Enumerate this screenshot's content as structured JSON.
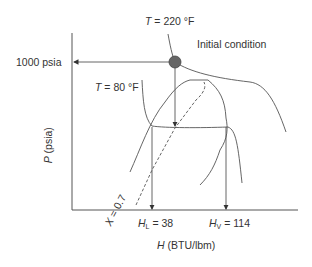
{
  "labels": {
    "t_high_var": "T",
    "t_high_val": " = 220 °F",
    "t_low_var": "T",
    "t_low_val": " = 80 °F",
    "initial_condition": "Initial condition",
    "pressure": "1000 psia",
    "y_axis_var": "P",
    "y_axis_unit": " (psia)",
    "x_axis_var": "H",
    "x_axis_unit": " (BTU/lbm)",
    "hl_var": "H",
    "hl_sub": "L",
    "hl_val": " = 38",
    "hv_var": "H",
    "hv_sub": "V",
    "hv_val": " = 114",
    "quality_var": "X",
    "quality_val": " = 0.7"
  },
  "colors": {
    "line": "#555555",
    "text": "#333333",
    "point": "#666666"
  }
}
